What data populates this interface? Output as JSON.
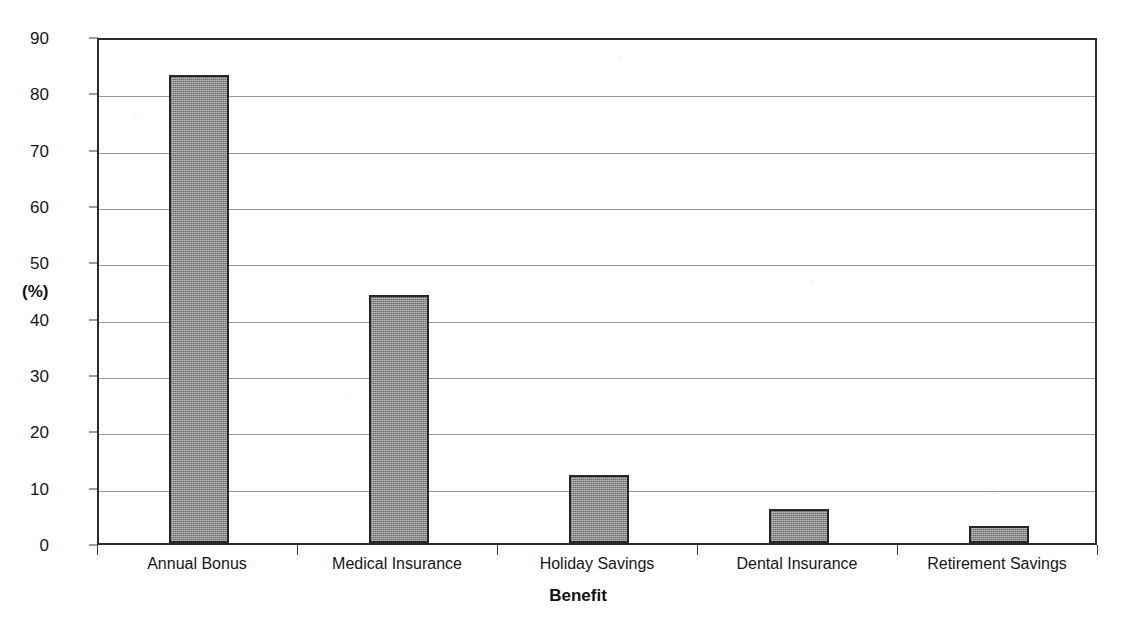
{
  "chart_data": {
    "type": "bar",
    "title": "",
    "subtitle": "",
    "categories": [
      "Annual Bonus",
      "Medical Insurance",
      "Holiday Savings",
      "Dental Insurance",
      "Retirement Savings"
    ],
    "values": [
      83,
      44,
      12,
      6,
      3
    ],
    "xlabel": "Benefit",
    "ylabel": "(%)",
    "ylim": [
      0,
      90
    ],
    "ytick_values": [
      0,
      10,
      20,
      30,
      40,
      50,
      60,
      70,
      80,
      90
    ],
    "ytick_labels": [
      "0",
      "10",
      "20",
      "30",
      "40",
      "50",
      "60",
      "70",
      "80",
      "90"
    ],
    "grid": "horizontal",
    "legend": "none",
    "bar_fill_color": "#8a8a8a",
    "bar_border_color": "#262626",
    "gridline_color": "#9a9a9a",
    "axis_color": "#2b2b2b",
    "background_color": "#ffffff",
    "annotations": []
  }
}
